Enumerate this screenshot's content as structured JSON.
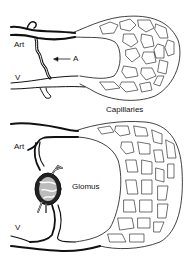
{
  "diagram": {
    "panels": [
      {
        "id": "top",
        "labels": {
          "artery": "Art",
          "vein": "V",
          "anastomosis": "A",
          "capillaries": "Capillaries"
        }
      },
      {
        "id": "bottom",
        "labels": {
          "artery": "Art",
          "vein": "V",
          "glomus": "Glomus"
        }
      }
    ],
    "colors": {
      "vessel": "#111111",
      "background": "#ffffff"
    }
  }
}
